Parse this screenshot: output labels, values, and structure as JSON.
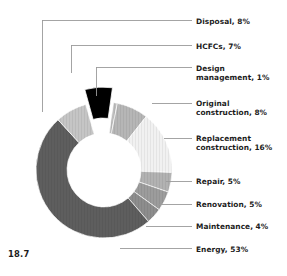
{
  "figure": {
    "number": "18.7",
    "background_color": "#ffffff",
    "text_color": "#1c1c1c",
    "leader_line_color": "#9a9a9a"
  },
  "chart_data": {
    "type": "pie",
    "variant": "donut",
    "title": "",
    "subtitle": "",
    "xlabel": "",
    "ylabel": "",
    "legend_position": "callout-labels-right",
    "grid": false,
    "units": "percent",
    "center": {
      "x": 104,
      "y": 170
    },
    "outer_radius": 68,
    "inner_radius": 37,
    "start_angle_deg": -82,
    "direction": "clockwise",
    "total": 107,
    "categories": [
      "Design management",
      "Original construction",
      "Replacement construction",
      "Repair",
      "Renovation",
      "Maintenance",
      "Energy",
      "Disposal",
      "HCFCs"
    ],
    "values": [
      1,
      8,
      16,
      5,
      5,
      4,
      53,
      8,
      7
    ],
    "slices": [
      {
        "name": "Design management",
        "label": "Design\nmanagement, 1%",
        "value": 1,
        "color": "#bdbdbd",
        "exploded": false,
        "label_x": 196,
        "label_y": 64,
        "leader": {
          "elbow_x": 96,
          "elbow_y": 67,
          "drop_to_y": 96
        }
      },
      {
        "name": "Original construction",
        "label": "Original\nconstruction, 8%",
        "value": 8,
        "color": "#b6b6b6",
        "exploded": false,
        "label_x": 196,
        "label_y": 99,
        "leader": {
          "x1": 152,
          "y1": 103,
          "x2": 192,
          "y2": 103
        }
      },
      {
        "name": "Replacement construction",
        "label": "Replacement\nconstruction, 16%",
        "value": 16,
        "color": "#f1f1f1",
        "exploded": false,
        "label_x": 196,
        "label_y": 134,
        "leader": {
          "x1": 164,
          "y1": 138,
          "x2": 192,
          "y2": 138
        }
      },
      {
        "name": "Repair",
        "label": "Repair, 5%",
        "value": 5,
        "color": "#b2b2b2",
        "exploded": false,
        "label_x": 196,
        "label_y": 177,
        "leader": {
          "x1": 166,
          "y1": 181,
          "x2": 192,
          "y2": 181
        }
      },
      {
        "name": "Renovation",
        "label": "Renovation, 5%",
        "value": 5,
        "color": "#9c9c9c",
        "exploded": false,
        "label_x": 196,
        "label_y": 200,
        "leader": {
          "x1": 158,
          "y1": 204,
          "x2": 192,
          "y2": 204
        }
      },
      {
        "name": "Maintenance",
        "label": "Maintenance, 4%",
        "value": 4,
        "color": "#8d8d8d",
        "exploded": false,
        "label_x": 196,
        "label_y": 222,
        "leader": {
          "x1": 146,
          "y1": 226,
          "x2": 192,
          "y2": 226
        }
      },
      {
        "name": "Energy",
        "label": "Energy, 53%",
        "value": 53,
        "color": "#5e5e5e",
        "exploded": false,
        "label_x": 196,
        "label_y": 245,
        "leader": {
          "x1": 120,
          "y1": 248,
          "x2": 192,
          "y2": 248
        }
      },
      {
        "name": "Disposal",
        "label": "Disposal, 8%",
        "value": 8,
        "color": "#c5c5c5",
        "exploded": false,
        "label_x": 196,
        "label_y": 17,
        "leader": {
          "elbow_x": 42,
          "elbow_y": 20,
          "drop_to_y": 112
        }
      },
      {
        "name": "HCFCs",
        "label": "HCFCs, 7%",
        "value": 7,
        "color": "#000000",
        "exploded": true,
        "label_x": 196,
        "label_y": 42,
        "leader": {
          "elbow_x": 71,
          "elbow_y": 45,
          "drop_to_y": 73
        }
      }
    ]
  }
}
